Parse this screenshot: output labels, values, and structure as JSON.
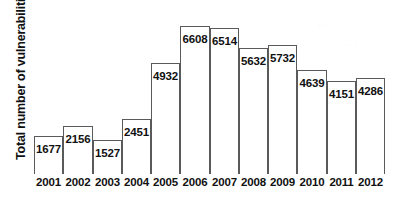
{
  "chart_data": {
    "type": "bar",
    "title": "",
    "xlabel": "",
    "ylabel": "Total number of vulnerabilities",
    "categories": [
      "2001",
      "2002",
      "2003",
      "2004",
      "2005",
      "2006",
      "2007",
      "2008",
      "2009",
      "2010",
      "2011",
      "2012"
    ],
    "values": [
      1677,
      2156,
      1527,
      2451,
      4932,
      6608,
      6514,
      5632,
      5732,
      4639,
      4151,
      4286
    ],
    "value_labels": [
      "1677",
      "2156",
      "1527",
      "2451",
      "4932",
      "6608",
      "6514",
      "5632",
      "5732",
      "4639",
      "4151",
      "4286"
    ],
    "ylim": [
      0,
      7400
    ],
    "grid": false,
    "legend": null,
    "series_name": "Total number of vulnerabilities",
    "bar_fill_color": "#ffffff",
    "bar_stroke_color": "#5a5a5a",
    "axis_color": "#4a4a4a",
    "text_color": "#111111"
  }
}
